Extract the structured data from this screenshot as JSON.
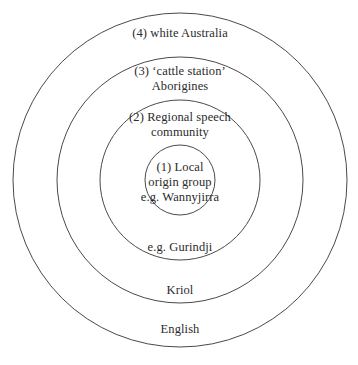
{
  "diagram": {
    "type": "nested-concentric-circles",
    "background_color": "#ffffff",
    "stroke_color": "#4a4a4a",
    "text_color": "#2b2b2b",
    "levels": [
      {
        "number": "(4)",
        "name": "white Australia",
        "top_label": "(4) white Australia",
        "bottom_label": "English",
        "radius": 167
      },
      {
        "number": "(3)",
        "name": "‘cattle station’ Aborigines",
        "top_label": "(3) ‘cattle station’\nAborigines",
        "bottom_label": "Kriol",
        "radius": 123
      },
      {
        "number": "(2)",
        "name": "Regional speech community",
        "top_label": "(2) Regional speech\ncommunity",
        "bottom_label": "e.g. Gurindji",
        "radius": 80
      },
      {
        "number": "(1)",
        "name": "Local origin group",
        "top_label": "(1) Local\norigin group\ne.g. Wannyjirra",
        "bottom_label": "",
        "radius": 35
      }
    ],
    "labels": {
      "outer_top": "(4) white Australia",
      "ring3_top": "(3) ‘cattle station’\nAborigines",
      "ring2_top": "(2) Regional speech\ncommunity",
      "inner": "(1) Local\norigin group\ne.g. Wannyjirra",
      "ring2_bottom": "e.g. Gurindji",
      "ring3_bottom": "Kriol",
      "outer_bottom": "English"
    }
  }
}
